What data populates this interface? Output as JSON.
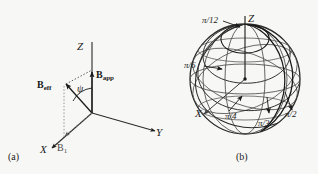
{
  "figure": {
    "background_color": "#f7f7f5",
    "ink_color": "#1a1a1a",
    "width": 318,
    "height": 174
  },
  "panel_a": {
    "caption": "(a)",
    "axes": {
      "z": "Z",
      "x": "X",
      "y": "Y"
    },
    "vectors": [
      {
        "name": "b-eff",
        "label_main": "B",
        "label_sub": "eff"
      },
      {
        "name": "b-app",
        "label_main": "B",
        "label_sub": "app"
      }
    ],
    "field_component": {
      "label_main": "B",
      "label_sub": "1"
    },
    "angle": {
      "symbol": "ψ",
      "name": "psi"
    }
  },
  "panel_b": {
    "caption": "(b)",
    "axes": {
      "z": "Z",
      "x": "X"
    },
    "trajectory_labels": [
      {
        "name": "pi-over-12",
        "text": "π/12"
      },
      {
        "name": "pi-over-6",
        "text": "π/6"
      },
      {
        "name": "pi-over-4",
        "text": "π/4"
      },
      {
        "name": "pi-over-3",
        "text": "π/3"
      },
      {
        "name": "pi-over-2",
        "text": "π/2"
      }
    ],
    "sphere": {
      "center_x": 245,
      "center_y": 79,
      "radius": 55
    }
  }
}
